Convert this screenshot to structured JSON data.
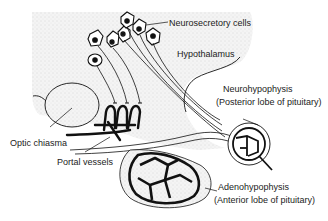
{
  "diagram": {
    "labels": {
      "neurosecretory_cells": "Neurosecretory cells",
      "hypothalamus": "Hypothalamus",
      "neurohypophysis": "Neurohypophysis",
      "neurohypophysis_sub": "(Posterior lobe of pituitary)",
      "optic_chiasma": "Optic chiasma",
      "portal_vessels": "Portal vessels",
      "adenohypophysis": "Adenohypophysis",
      "adenohypophysis_sub": "(Anterior lobe of pituitary)"
    },
    "colors": {
      "line": "#111111",
      "stipple": "#e8e8e8",
      "background": "#ffffff"
    }
  }
}
